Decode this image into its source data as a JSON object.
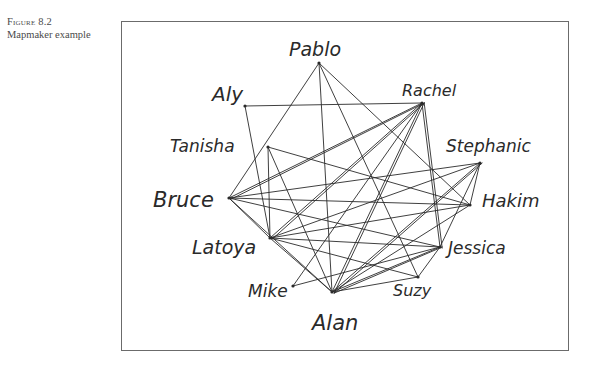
{
  "caption": {
    "figure_number": "Figure 8.2",
    "title": "Mapmaker example"
  },
  "diagram": {
    "type": "hand-drawn social network map",
    "nodes": [
      {
        "id": "pablo",
        "label": "Pablo",
        "x": 319,
        "y": 63,
        "lx": 289,
        "ly": 56,
        "size": 19
      },
      {
        "id": "aly",
        "label": "Aly",
        "x": 245,
        "y": 106,
        "lx": 212,
        "ly": 101,
        "size": 20
      },
      {
        "id": "rachel",
        "label": "Rachel",
        "x": 422,
        "y": 103,
        "lx": 402,
        "ly": 96,
        "size": 16
      },
      {
        "id": "tanisha",
        "label": "Tanisha",
        "x": 268,
        "y": 147,
        "lx": 170,
        "ly": 152,
        "size": 17
      },
      {
        "id": "stephanie",
        "label": "Stephanic",
        "x": 480,
        "y": 163,
        "lx": 446,
        "ly": 152,
        "size": 17
      },
      {
        "id": "bruce",
        "label": "Bruce",
        "x": 229,
        "y": 198,
        "lx": 153,
        "ly": 207,
        "size": 21
      },
      {
        "id": "hakim",
        "label": "Hakim",
        "x": 470,
        "y": 205,
        "lx": 482,
        "ly": 207,
        "size": 18
      },
      {
        "id": "latoya",
        "label": "Latoya",
        "x": 270,
        "y": 238,
        "lx": 192,
        "ly": 254,
        "size": 19
      },
      {
        "id": "jessica",
        "label": "Jessica",
        "x": 440,
        "y": 247,
        "lx": 448,
        "ly": 254,
        "size": 17
      },
      {
        "id": "mike",
        "label": "Mike",
        "x": 293,
        "y": 286,
        "lx": 248,
        "ly": 297,
        "size": 17
      },
      {
        "id": "suzy",
        "label": "Suzy",
        "x": 418,
        "y": 277,
        "lx": 393,
        "ly": 296,
        "size": 16
      },
      {
        "id": "alan",
        "label": "Alan",
        "x": 332,
        "y": 292,
        "lx": 312,
        "ly": 330,
        "size": 21
      }
    ],
    "edges": [
      [
        "pablo",
        "bruce"
      ],
      [
        "pablo",
        "alan"
      ],
      [
        "pablo",
        "suzy"
      ],
      [
        "pablo",
        "hakim"
      ],
      [
        "aly",
        "rachel"
      ],
      [
        "aly",
        "latoya"
      ],
      [
        "rachel",
        "bruce"
      ],
      [
        "rachel",
        "latoya"
      ],
      [
        "rachel",
        "alan"
      ],
      [
        "rachel",
        "mike"
      ],
      [
        "rachel",
        "jessica"
      ],
      [
        "rachel",
        "bruce"
      ],
      [
        "rachel",
        "alan"
      ],
      [
        "rachel",
        "latoya"
      ],
      [
        "tanisha",
        "alan"
      ],
      [
        "tanisha",
        "hakim"
      ],
      [
        "tanisha",
        "latoya"
      ],
      [
        "stephanie",
        "bruce"
      ],
      [
        "stephanie",
        "latoya"
      ],
      [
        "stephanie",
        "alan"
      ],
      [
        "stephanie",
        "jessica"
      ],
      [
        "stephanie",
        "alan"
      ],
      [
        "stephanie",
        "hakim"
      ],
      [
        "bruce",
        "latoya"
      ],
      [
        "bruce",
        "alan"
      ],
      [
        "bruce",
        "hakim"
      ],
      [
        "bruce",
        "jessica"
      ],
      [
        "latoya",
        "jessica"
      ],
      [
        "latoya",
        "alan"
      ],
      [
        "latoya",
        "hakim"
      ],
      [
        "latoya",
        "suzy"
      ],
      [
        "jessica",
        "alan"
      ],
      [
        "jessica",
        "alan"
      ],
      [
        "jessica",
        "suzy"
      ],
      [
        "jessica",
        "mike"
      ],
      [
        "alan",
        "suzy"
      ],
      [
        "hakim",
        "alan"
      ],
      [
        "rachel",
        "jessica"
      ]
    ]
  },
  "colors": {
    "ink": "#2a2a2a",
    "frame": "#6b6b6b",
    "caption": "#4a4a4a",
    "background": "#ffffff"
  }
}
